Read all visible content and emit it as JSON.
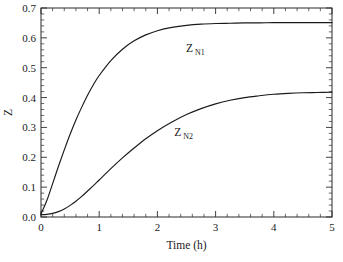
{
  "chart_data": {
    "type": "line",
    "title": "",
    "xlabel": "Time (h)",
    "ylabel": "Z",
    "xlim": [
      0,
      5
    ],
    "ylim": [
      0,
      0.7
    ],
    "grid": false,
    "legend_position": "inline-annotation",
    "x_ticks": [
      "0",
      "1",
      "2",
      "3",
      "4",
      "5"
    ],
    "x_tick_values": [
      0,
      1,
      2,
      3,
      4,
      5
    ],
    "x_minor_step": 0.2,
    "y_ticks": [
      "0.0",
      "0.1",
      "0.2",
      "0.3",
      "0.4",
      "0.5",
      "0.6",
      "0.7"
    ],
    "y_tick_values": [
      0.0,
      0.1,
      0.2,
      0.3,
      0.4,
      0.5,
      0.6,
      0.7
    ],
    "y_minor_step": 0.02,
    "x": [
      0,
      0.1,
      0.2,
      0.3,
      0.4,
      0.5,
      0.6,
      0.7,
      0.8,
      0.9,
      1.0,
      1.2,
      1.4,
      1.6,
      1.8,
      2.0,
      2.25,
      2.5,
      2.75,
      3.0,
      3.25,
      3.5,
      3.75,
      4.0,
      4.25,
      4.5,
      4.75,
      5.0
    ],
    "series": [
      {
        "name": "Z_N1",
        "label_main": "Z",
        "label_sub": "N1",
        "color": "#1a1a1a",
        "label_x": 2.55,
        "label_y": 0.553,
        "values": [
          0.01,
          0.055,
          0.112,
          0.17,
          0.225,
          0.277,
          0.325,
          0.368,
          0.408,
          0.443,
          0.474,
          0.524,
          0.562,
          0.59,
          0.61,
          0.624,
          0.635,
          0.642,
          0.646,
          0.648,
          0.649,
          0.65,
          0.65,
          0.651,
          0.651,
          0.651,
          0.651,
          0.651
        ]
      },
      {
        "name": "Z_N2",
        "label_main": "Z",
        "label_sub": "N2",
        "color": "#1a1a1a",
        "label_x": 2.35,
        "label_y": 0.272,
        "values": [
          0.008,
          0.009,
          0.012,
          0.018,
          0.027,
          0.039,
          0.053,
          0.069,
          0.087,
          0.105,
          0.124,
          0.162,
          0.198,
          0.231,
          0.262,
          0.289,
          0.318,
          0.343,
          0.363,
          0.379,
          0.391,
          0.4,
          0.406,
          0.411,
          0.414,
          0.416,
          0.417,
          0.418
        ]
      }
    ]
  },
  "figure": {
    "background_color": "#ffffff",
    "axis_color": "#2b2b2b",
    "text_color": "#1a1a1a"
  }
}
